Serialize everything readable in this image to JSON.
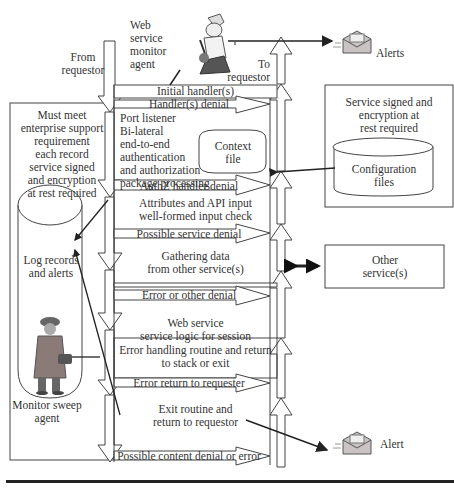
{
  "labels": {
    "web_service_monitor_agent": [
      "Web",
      "service",
      "monitor",
      "agent"
    ],
    "from_requestor": [
      "From",
      "requestor"
    ],
    "to_requestor": [
      "To",
      "requestor"
    ],
    "alerts_top": "Alerts",
    "alert_bottom": "Alert",
    "enterprise_requirement": [
      "Must meet",
      "enterprise support",
      "requirement",
      "each record",
      "service signed",
      "and encryption",
      "at rest required"
    ],
    "log_records": [
      "Log records",
      "and alerts"
    ],
    "monitor_sweep_agent": [
      "Monitor sweep",
      "agent"
    ],
    "service_signed_box": [
      "Service signed and",
      "encryption at",
      "rest required"
    ],
    "configuration_files": [
      "Configuration",
      "files"
    ],
    "context_file": [
      "Context",
      "file"
    ],
    "other_services": [
      "Other",
      "service(s)"
    ]
  },
  "flow": {
    "initial_handler": "Initial handler(s)",
    "handler_denial": "Handler(s) denial",
    "port_listener": [
      "Port listener",
      "Bi-lateral",
      "end-to-end",
      "authentication",
      "and authorization",
      "package processing"
    ],
    "authz_denial": "AuthZ handler denial",
    "attributes_check": [
      "Attributes and API input",
      "well-formed input check"
    ],
    "possible_service_denial": "Possible service denial",
    "gathering_data": [
      "Gathering data",
      "from other service(s)"
    ],
    "error_other_denial": "Error or other denial",
    "web_service_logic": [
      "Web service",
      "service logic for session"
    ],
    "error_handling": [
      "Error handling routine and return",
      "to stack or exit"
    ],
    "error_return": "Error return to requester",
    "exit_routine": [
      "Exit routine and",
      "return to requestor"
    ],
    "content_denial": "Possible content denial or error"
  },
  "colors": {
    "line": "#333333",
    "background": "#ffffff",
    "figure_coat": "#8a7a78",
    "envelope": "#c9c3c3"
  }
}
